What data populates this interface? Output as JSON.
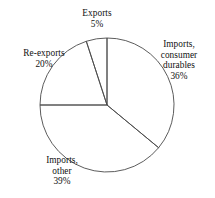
{
  "chart_data": {
    "type": "pie",
    "title": "",
    "subtitle": "",
    "xlabel": "",
    "ylabel": "",
    "grid": false,
    "legend_position": "none",
    "label_style": "outside-callout-text",
    "units": "percent",
    "total": 100,
    "start_angle_deg": 0,
    "direction": "clockwise",
    "categories": [
      "Imports, consumer durables",
      "Imports, other",
      "Re-exports",
      "Exports"
    ],
    "values": [
      36,
      39,
      20,
      5
    ],
    "slices": [
      {
        "name": "imports-consumer-durables",
        "label_lines": [
          "Imports,",
          "consumer",
          "durables",
          "36%"
        ],
        "value": 36,
        "value_text": "36%",
        "start_deg": 0,
        "end_deg": 129.6,
        "fill": "none",
        "stroke": "#4a4a4a"
      },
      {
        "name": "imports-other",
        "label_lines": [
          "Imports,",
          "other",
          "39%"
        ],
        "value": 39,
        "value_text": "39%",
        "start_deg": 129.6,
        "end_deg": 270.0,
        "fill": "none",
        "stroke": "#4a4a4a"
      },
      {
        "name": "re-exports",
        "label_lines": [
          "Re-exports",
          "20%"
        ],
        "value": 20,
        "value_text": "20%",
        "start_deg": 270.0,
        "end_deg": 342.0,
        "fill": "none",
        "stroke": "#4a4a4a"
      },
      {
        "name": "exports",
        "label_lines": [
          "Exports",
          "5%"
        ],
        "value": 5,
        "value_text": "5%",
        "start_deg": 342.0,
        "end_deg": 360.0,
        "fill": "none",
        "stroke": "#4a4a4a"
      }
    ],
    "geometry": {
      "center_x": 107,
      "center_y": 105,
      "radius": 67
    },
    "colors": {
      "background": "#ffffff",
      "stroke": "#4a4a4a",
      "text": "#111111"
    }
  },
  "labels": {
    "exports": {
      "line1": "Exports",
      "line2": "5%"
    },
    "consumer_durables": {
      "line1": "Imports,",
      "line2": "consumer",
      "line3": "durables",
      "line4": "36%"
    },
    "reexports": {
      "line1": "Re-exports",
      "line2": "20%"
    },
    "imports_other": {
      "line1": "Imports,",
      "line2": "other",
      "line3": "39%"
    }
  }
}
